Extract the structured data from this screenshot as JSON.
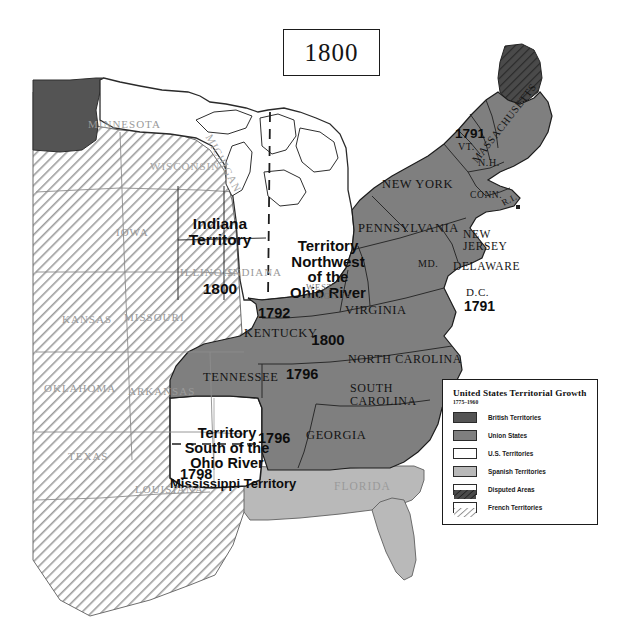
{
  "map": {
    "year_title": "1800",
    "legend": {
      "title": "United States Territorial Growth",
      "subtitle": "1775–1960",
      "items": [
        {
          "label": "British Territories",
          "color": "#545454",
          "pattern": "solid"
        },
        {
          "label": "Union States",
          "color": "#7f7f7f",
          "pattern": "solid"
        },
        {
          "label": "U.S. Territories",
          "color": "#ffffff",
          "pattern": "solid"
        },
        {
          "label": "Spanish Territories",
          "color": "#b9b9b9",
          "pattern": "solid"
        },
        {
          "label": "Disputed Areas",
          "color": "#4a4a4a",
          "pattern": "hatch"
        },
        {
          "label": "French Territories",
          "color": "#ffffff",
          "pattern": "hatch"
        }
      ]
    },
    "territory_labels": [
      {
        "name": "indiana-territory",
        "lines": "Indiana\nTerritory",
        "date": "1800"
      },
      {
        "name": "territory-northwest-ohio",
        "lines": "Territory\nNorthwest\nof the\nOhio River",
        "date": "1800"
      },
      {
        "name": "territory-south-ohio",
        "lines": "Territory\nSouth of the\nOhio River",
        "date": "1796"
      },
      {
        "name": "mississippi-territory",
        "lines": "Mississippi Territory",
        "date": "1798"
      }
    ],
    "state_labels": {
      "new_york": "NEW YORK",
      "pennsylvania": "PENNSYLVANIA",
      "massachusetts": "MASSACHUSETTS",
      "new_hampshire": "N.H.",
      "vermont": "VT.",
      "vermont_date": "1791",
      "connecticut": "CONN.",
      "rhode_island": "R.I.",
      "new_jersey": "NEW\nJERSEY",
      "delaware": "DELAWARE",
      "maryland": "MD.",
      "dc": "D.C.",
      "dc_date": "1791",
      "virginia": "VIRGINIA",
      "west_virginia": "WEST\nVIRGINIA",
      "kentucky": "KENTUCKY",
      "kentucky_date": "1792",
      "tennessee": "TENNESSEE",
      "tennessee_date": "1796",
      "north_carolina": "NORTH CAROLINA",
      "south_carolina": "SOUTH\nCAROLINA",
      "georgia": "GEORGIA",
      "florida": "FLORIDA",
      "louisiana": "LOUISIANA",
      "texas": "TEXAS",
      "oklahoma": "OKLAHOMA",
      "arkansas": "ARKANSAS",
      "kansas": "KANSAS",
      "missouri": "MISSOURI",
      "iowa": "IOWA",
      "minnesota": "MINNESOTA",
      "wisconsin": "WISCONSIN",
      "michigan": "MICHIGAN",
      "illinois": "ILLINOIS",
      "indiana": "INDIANA"
    }
  }
}
